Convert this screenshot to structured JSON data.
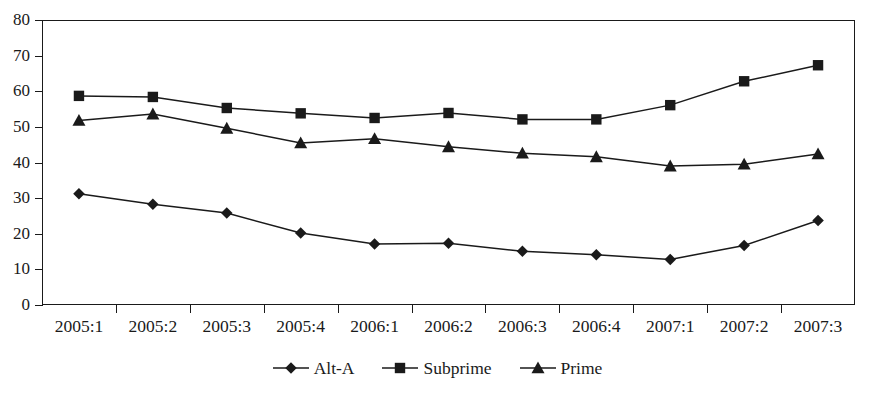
{
  "chart_data": {
    "type": "line",
    "title": "",
    "xlabel": "",
    "ylabel": "",
    "ylim": [
      0,
      80
    ],
    "ytick_step": 10,
    "grid": false,
    "legend_position": "bottom-center",
    "categories": [
      "2005:1",
      "2005:2",
      "2005:3",
      "2005:4",
      "2006:1",
      "2006:2",
      "2006:3",
      "2006:4",
      "2007:1",
      "2007:2",
      "2007:3"
    ],
    "yticks": [
      "0",
      "10",
      "20",
      "30",
      "40",
      "50",
      "60",
      "70",
      "80"
    ],
    "series": [
      {
        "name": "Alt-A",
        "marker": "diamond",
        "values": [
          31.2,
          28.3,
          25.8,
          20.2,
          17.1,
          17.3,
          15.1,
          14.1,
          12.8,
          16.7,
          23.7
        ]
      },
      {
        "name": "Subprime",
        "marker": "square",
        "values": [
          58.7,
          58.4,
          55.3,
          53.8,
          52.5,
          53.9,
          52.1,
          52.1,
          56.1,
          62.8,
          67.3
        ]
      },
      {
        "name": "Prime",
        "marker": "triangle",
        "values": [
          51.8,
          53.6,
          49.6,
          45.5,
          46.7,
          44.4,
          42.6,
          41.6,
          39.0,
          39.5,
          42.4
        ]
      }
    ]
  },
  "legend": {
    "items": [
      {
        "label": "Alt-A",
        "marker": "diamond"
      },
      {
        "label": "Subprime",
        "marker": "square"
      },
      {
        "label": "Prime",
        "marker": "triangle"
      }
    ]
  },
  "colors": {
    "ink": "#1a1a1a",
    "background": "#ffffff"
  }
}
